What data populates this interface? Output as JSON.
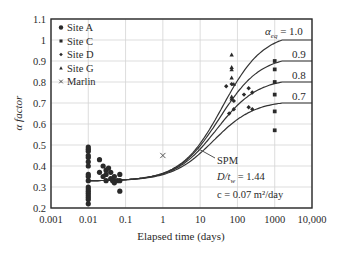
{
  "chart_data": {
    "type": "scatter",
    "title": "",
    "xlabel": "Elapsed time (days)",
    "ylabel": "α factor",
    "xscale": "log",
    "xlim": [
      0.001,
      10000
    ],
    "ylim": [
      0.2,
      1.1
    ],
    "grid": true,
    "x_ticks": [
      "0.001",
      "0.01",
      "0.1",
      "1",
      "10",
      "100",
      "1000",
      "10,000"
    ],
    "y_ticks": [
      "0.2",
      "0.3",
      "0.4",
      "0.5",
      "0.6",
      "0.7",
      "0.8",
      "0.9",
      "1",
      "1.1"
    ],
    "legend": {
      "position": "upper-left",
      "entries": [
        {
          "label": "Site A",
          "marker": "circle"
        },
        {
          "label": "Site C",
          "marker": "square"
        },
        {
          "label": "Site D",
          "marker": "diamond"
        },
        {
          "label": "Site G",
          "marker": "triangle"
        },
        {
          "label": "Marlin",
          "marker": "x"
        }
      ]
    },
    "series": [
      {
        "name": "Site A",
        "marker": "circle",
        "points": [
          [
            0.01,
            0.22
          ],
          [
            0.01,
            0.24
          ],
          [
            0.01,
            0.25
          ],
          [
            0.01,
            0.26
          ],
          [
            0.01,
            0.27
          ],
          [
            0.01,
            0.28
          ],
          [
            0.01,
            0.29
          ],
          [
            0.01,
            0.3
          ],
          [
            0.01,
            0.33
          ],
          [
            0.01,
            0.35
          ],
          [
            0.01,
            0.36
          ],
          [
            0.01,
            0.4
          ],
          [
            0.01,
            0.42
          ],
          [
            0.01,
            0.44
          ],
          [
            0.01,
            0.45
          ],
          [
            0.01,
            0.47
          ],
          [
            0.01,
            0.48
          ],
          [
            0.01,
            0.49
          ],
          [
            0.02,
            0.43
          ],
          [
            0.02,
            0.37
          ],
          [
            0.025,
            0.4
          ],
          [
            0.025,
            0.35
          ],
          [
            0.03,
            0.38
          ],
          [
            0.03,
            0.33
          ],
          [
            0.03,
            0.36
          ],
          [
            0.035,
            0.39
          ],
          [
            0.04,
            0.34
          ],
          [
            0.04,
            0.37
          ],
          [
            0.045,
            0.33
          ],
          [
            0.05,
            0.35
          ],
          [
            0.05,
            0.32
          ],
          [
            0.06,
            0.33
          ],
          [
            0.07,
            0.36
          ],
          [
            0.07,
            0.28
          ],
          [
            0.07,
            0.33
          ]
        ]
      },
      {
        "name": "Site C",
        "marker": "square",
        "points": [
          [
            1000,
            0.9
          ],
          [
            1000,
            0.86
          ],
          [
            1000,
            0.8
          ],
          [
            1000,
            0.74
          ],
          [
            1000,
            0.66
          ],
          [
            1000,
            0.57
          ]
        ]
      },
      {
        "name": "Site D",
        "marker": "diamond",
        "points": [
          [
            50,
            0.78
          ],
          [
            70,
            0.79
          ],
          [
            80,
            0.71
          ],
          [
            80,
            0.67
          ],
          [
            60,
            0.65
          ],
          [
            200,
            0.77
          ],
          [
            250,
            0.75
          ],
          [
            150,
            0.74
          ],
          [
            200,
            0.68
          ],
          [
            250,
            0.67
          ]
        ]
      },
      {
        "name": "Site G",
        "marker": "triangle",
        "points": [
          [
            70,
            0.93
          ],
          [
            70,
            0.87
          ],
          [
            70,
            0.86
          ],
          [
            70,
            0.82
          ],
          [
            80,
            0.79
          ],
          [
            70,
            0.73
          ],
          [
            70,
            0.72
          ]
        ]
      },
      {
        "name": "Marlin",
        "marker": "x",
        "points": [
          [
            1,
            0.45
          ]
        ]
      }
    ],
    "curves": [
      {
        "label": "α_eq = 1.0",
        "alpha_eq": 1.0
      },
      {
        "label": "0.9",
        "alpha_eq": 0.9
      },
      {
        "label": "0.8",
        "alpha_eq": 0.8
      },
      {
        "label": "0.7",
        "alpha_eq": 0.7
      }
    ],
    "annotations": {
      "curve_label": "SPM",
      "ratio_label_prefix": "D/t",
      "ratio_label_sub": "w",
      "ratio_label_value": " = 1.44",
      "c_label": "c = 0.07 m²/day"
    },
    "curve_labels": {
      "alpha_symbol": "α",
      "alpha_sub": "eq",
      "alpha_top_value": " = 1.0",
      "others": [
        "0.9",
        "0.8",
        "0.7"
      ]
    }
  }
}
